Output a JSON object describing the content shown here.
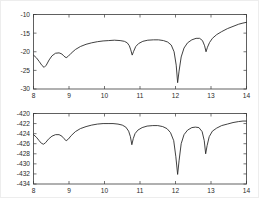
{
  "figure": {
    "title": "",
    "background": "#ffffff",
    "border_color": "#ededed",
    "axis_color": "#3a3a3a",
    "curve_color": "#2b2b2b"
  },
  "chart_data": [
    {
      "type": "line",
      "title": "",
      "xlabel": "",
      "ylabel": "",
      "xlim": [
        8,
        14
      ],
      "ylim": [
        -30,
        -10
      ],
      "xticks": [
        8,
        9,
        10,
        11,
        12,
        13,
        14
      ],
      "xticklabels": [
        "8",
        "9",
        "10",
        "11",
        "12",
        "13",
        "14"
      ],
      "yticks": [
        -30,
        -25,
        -20,
        -15,
        -10
      ],
      "yticklabels": [
        "-30",
        "-25",
        "-20",
        "-15",
        "-10"
      ],
      "grid": false,
      "legend": null,
      "series": [
        {
          "name": "top-response",
          "x": [
            8.0,
            8.08,
            8.16,
            8.24,
            8.3,
            8.36,
            8.44,
            8.52,
            8.62,
            8.72,
            8.8,
            8.86,
            8.92,
            8.98,
            9.06,
            9.18,
            9.32,
            9.48,
            9.64,
            9.8,
            9.96,
            10.12,
            10.28,
            10.44,
            10.56,
            10.64,
            10.7,
            10.74,
            10.78,
            10.82,
            10.88,
            10.96,
            11.08,
            11.22,
            11.38,
            11.52,
            11.66,
            11.78,
            11.88,
            11.96,
            12.02,
            12.06,
            12.1,
            12.16,
            12.24,
            12.34,
            12.46,
            12.58,
            12.68,
            12.76,
            12.82,
            12.86,
            12.9,
            12.96,
            13.04,
            13.16,
            13.3,
            13.46,
            13.62,
            13.78,
            13.9,
            14.0
          ],
          "y": [
            -20.9,
            -21.6,
            -22.6,
            -23.7,
            -24.2,
            -23.6,
            -22.2,
            -21.1,
            -20.4,
            -20.3,
            -20.6,
            -21.2,
            -21.6,
            -21.2,
            -20.4,
            -19.4,
            -18.6,
            -18.0,
            -17.6,
            -17.3,
            -17.1,
            -17.0,
            -16.9,
            -17.0,
            -17.2,
            -17.6,
            -18.4,
            -19.5,
            -20.9,
            -19.9,
            -18.6,
            -17.8,
            -17.2,
            -16.9,
            -16.8,
            -16.8,
            -17.0,
            -17.4,
            -18.2,
            -20.0,
            -23.6,
            -28.3,
            -25.2,
            -21.4,
            -19.0,
            -17.6,
            -16.8,
            -16.4,
            -16.4,
            -17.0,
            -18.4,
            -20.0,
            -18.8,
            -17.5,
            -16.4,
            -15.4,
            -14.6,
            -13.8,
            -13.2,
            -12.6,
            -12.3,
            -12.1
          ]
        }
      ]
    },
    {
      "type": "line",
      "title": "",
      "xlabel": "",
      "ylabel": "",
      "xlim": [
        8,
        14
      ],
      "ylim": [
        -434,
        -420
      ],
      "xticks": [
        8,
        9,
        10,
        11,
        12,
        13,
        14
      ],
      "xticklabels": [
        "8",
        "9",
        "10",
        "11",
        "12",
        "13",
        "14"
      ],
      "yticks": [
        -434,
        -432,
        -430,
        -428,
        -426,
        -424,
        -422,
        -420
      ],
      "yticklabels": [
        "-434",
        "-432",
        "-430",
        "-428",
        "-426",
        "-424",
        "-422",
        "-420"
      ],
      "grid": false,
      "legend": null,
      "series": [
        {
          "name": "bottom-response",
          "x": [
            8.0,
            8.08,
            8.16,
            8.22,
            8.28,
            8.34,
            8.42,
            8.52,
            8.62,
            8.72,
            8.8,
            8.86,
            8.92,
            8.98,
            9.06,
            9.18,
            9.32,
            9.48,
            9.64,
            9.8,
            9.96,
            10.1,
            10.24,
            10.38,
            10.5,
            10.6,
            10.68,
            10.73,
            10.77,
            10.81,
            10.86,
            10.94,
            11.06,
            11.2,
            11.36,
            11.5,
            11.64,
            11.76,
            11.86,
            11.95,
            12.01,
            12.06,
            12.1,
            12.16,
            12.24,
            12.34,
            12.46,
            12.56,
            12.66,
            12.75,
            12.81,
            12.85,
            12.89,
            12.95,
            13.04,
            13.16,
            13.3,
            13.46,
            13.62,
            13.78,
            13.9,
            14.0
          ],
          "y": [
            -424.2,
            -424.7,
            -425.4,
            -425.9,
            -426.1,
            -425.8,
            -425.1,
            -424.5,
            -424.2,
            -424.2,
            -424.5,
            -425.0,
            -425.4,
            -425.1,
            -424.4,
            -423.6,
            -423.0,
            -422.6,
            -422.3,
            -422.1,
            -422.0,
            -422.0,
            -422.0,
            -422.1,
            -422.3,
            -422.7,
            -423.5,
            -424.6,
            -426.2,
            -425.0,
            -424.0,
            -423.3,
            -422.8,
            -422.5,
            -422.4,
            -422.4,
            -422.6,
            -423.0,
            -423.8,
            -425.4,
            -428.6,
            -432.1,
            -429.4,
            -426.0,
            -424.2,
            -423.3,
            -422.8,
            -422.7,
            -422.8,
            -423.6,
            -425.4,
            -428.0,
            -426.4,
            -424.6,
            -423.5,
            -422.9,
            -422.4,
            -422.1,
            -421.8,
            -421.6,
            -421.5,
            -421.5
          ]
        }
      ]
    }
  ]
}
